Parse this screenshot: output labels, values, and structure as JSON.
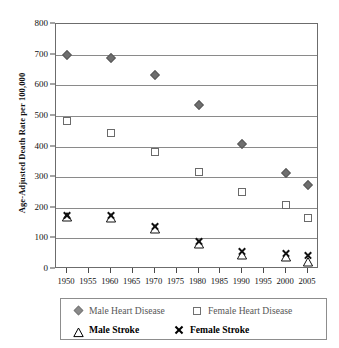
{
  "chart_data": {
    "type": "scatter",
    "title": "",
    "xlabel": "",
    "ylabel": "Age-Adjusted Death Rate per 100,000",
    "ylim": [
      0,
      800
    ],
    "ytick_step": 100,
    "yticks": [
      "800",
      "700",
      "600",
      "500",
      "400",
      "300",
      "200",
      "100",
      "0"
    ],
    "xlim": [
      1947.5,
      2007.5
    ],
    "xticks": [
      "1950",
      "1955",
      "1960",
      "1965",
      "1970",
      "1975",
      "1980",
      "1985",
      "1990",
      "1995",
      "2000",
      "2005"
    ],
    "grid": true,
    "legend_position": "bottom",
    "x": [
      1950,
      1960,
      1970,
      1980,
      1990,
      2000,
      2005
    ],
    "series": [
      {
        "name": "Male Heart Disease",
        "marker": "filled-diamond",
        "color": "#6f6f6f",
        "values": [
          699,
          688,
          632,
          535,
          408,
          315,
          275
        ]
      },
      {
        "name": "Female Heart Disease",
        "marker": "open-square",
        "color": "#6a6a6a",
        "values": [
          484,
          444,
          381,
          316,
          252,
          210,
          167
        ]
      },
      {
        "name": "Male Stroke",
        "marker": "open-triangle",
        "color": "#111111",
        "values": [
          182,
          181,
          144,
          94,
          59,
          52,
          37
        ]
      },
      {
        "name": "Female Stroke",
        "marker": "x-cross",
        "color": "#111111",
        "values": [
          176,
          175,
          141,
          91,
          59,
          53,
          45
        ]
      }
    ]
  },
  "legend": {
    "entries": [
      {
        "label": "Male Heart Disease",
        "marker": "filled-diamond"
      },
      {
        "label": "Female Heart Disease",
        "marker": "open-square"
      },
      {
        "label": "Male Stroke",
        "marker": "open-triangle"
      },
      {
        "label": "Female Stroke",
        "marker": "x-cross"
      }
    ]
  }
}
